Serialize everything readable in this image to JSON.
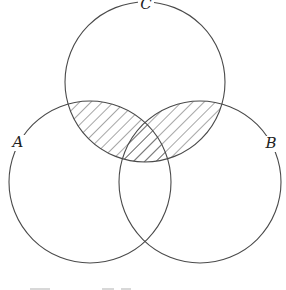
{
  "diagram": {
    "type": "venn",
    "sets": [
      {
        "id": "A",
        "label": "A",
        "cx": 90,
        "cy": 182,
        "r": 81,
        "label_x": 18,
        "label_y": 147
      },
      {
        "id": "B",
        "label": "B",
        "cx": 200,
        "cy": 182,
        "r": 81,
        "label_x": 271,
        "label_y": 148
      },
      {
        "id": "C",
        "label": "C",
        "cx": 145,
        "cy": 82,
        "r": 80,
        "label_x": 146,
        "label_y": 9
      }
    ],
    "shaded_region": "(A ∪ B) ∩ C",
    "shading_style": "diagonal-hatch",
    "colors": {
      "stroke": "#4a4a4a",
      "hatch": "#3a3a3a",
      "background": "#ffffff"
    }
  }
}
